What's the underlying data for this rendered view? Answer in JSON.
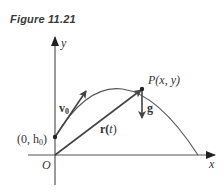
{
  "figure": {
    "caption": "Figure 11.21",
    "labels": {
      "y_axis": "y",
      "x_axis": "x",
      "origin": "O",
      "initial_point": "(0, h",
      "initial_point_sub": "0",
      "initial_point_close": ")",
      "velocity": "v",
      "velocity_sub": "0",
      "position_vector": "r(",
      "position_vector_t": "t",
      "position_vector_close": ")",
      "point": "P(x, y)",
      "gravity": "g"
    },
    "colors": {
      "axis": "#333333",
      "curve": "#444444",
      "vector": "#444444",
      "text": "#333333"
    }
  }
}
